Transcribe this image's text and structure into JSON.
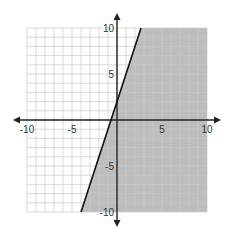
{
  "chart_data": {
    "type": "line",
    "title": "",
    "xlabel": "",
    "ylabel": "",
    "xlim": [
      -10,
      10
    ],
    "ylim": [
      -10,
      10
    ],
    "grid": true,
    "grid_step": 1,
    "x_ticks": [
      {
        "value": -10,
        "label": "-10"
      },
      {
        "value": -5,
        "label": "-5"
      },
      {
        "value": 5,
        "label": "5"
      },
      {
        "value": 10,
        "label": "10"
      }
    ],
    "y_ticks": [
      {
        "value": 10,
        "label": "10"
      },
      {
        "value": 5,
        "label": "5"
      },
      {
        "value": -5,
        "label": "-5"
      },
      {
        "value": -10,
        "label": "-10"
      }
    ],
    "series": [
      {
        "name": "boundary line",
        "equation": "y = 3x + 2",
        "slope": 3,
        "intercept": 2,
        "style": "solid",
        "points": [
          [
            -4,
            -10
          ],
          [
            2.67,
            10
          ]
        ]
      }
    ],
    "shaded_region": {
      "inequality": "y <= 3x + 2",
      "side": "right/below line",
      "color": "#bdbdbd"
    },
    "legend": []
  },
  "colors": {
    "shade": "#bdbdbd",
    "grid": "#c8c8c8",
    "axis": "#222222",
    "line": "#111111"
  }
}
